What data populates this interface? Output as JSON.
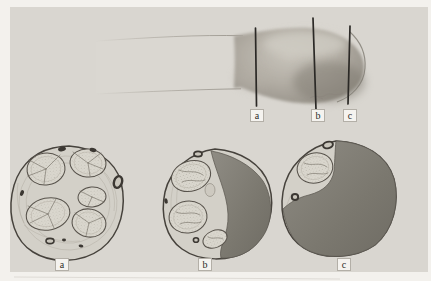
{
  "labels": {
    "top": [
      "a",
      "b",
      "c"
    ],
    "bottom": [
      "a",
      "b",
      "c"
    ]
  },
  "colors": {
    "page_bg": "#f3f1ed",
    "panel_bg": "#d9d6d0",
    "line": "#2b2926",
    "outline": "#46423c",
    "ground": "#d3d0c8",
    "fascicle": "#dad7ce",
    "vessel": "#3c3833",
    "mass": "#807d76",
    "label_bg": "#f5f3ef",
    "label_border": "#b3afa7",
    "label_text": "#2e2b27"
  }
}
